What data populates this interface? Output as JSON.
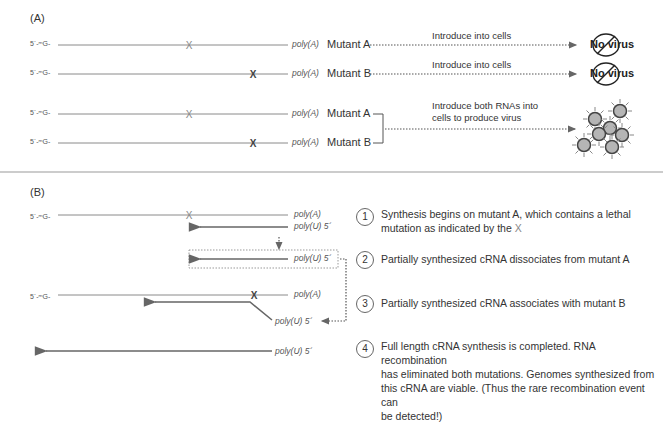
{
  "panel_a": {
    "label": "(A)",
    "rows": [
      {
        "cap": "5´-ᵐG-",
        "poly": "poly(A)",
        "mutant": "Mutant A",
        "note": "Introduce into cells",
        "result": "No virus"
      },
      {
        "cap": "5´-ᵐG-",
        "poly": "poly(A)",
        "mutant": "Mutant B",
        "note": "Introduce into cells",
        "result": "No virus"
      },
      {
        "cap": "5´-ᵐG-",
        "poly": "poly(A)",
        "mutant": "Mutant A"
      },
      {
        "cap": "5´-ᵐG-",
        "poly": "poly(A)",
        "mutant": "Mutant B"
      }
    ],
    "combined_note_line1": "Introduce both RNAs into",
    "combined_note_line2": "cells to produce virus",
    "icons": {
      "no_virus": "prohibition-circle",
      "virus": "virus-particle-cluster"
    }
  },
  "panel_b": {
    "label": "(B)",
    "cap": "5´-ᵐG-",
    "poly_a": "poly(A)",
    "poly_u": "poly(U) 5´",
    "steps": [
      {
        "num": "1",
        "line1": "Synthesis begins on mutant A, which contains a lethal",
        "line2": "mutation as indicated by the ",
        "x_mark": "X"
      },
      {
        "num": "2",
        "line1": "Partially synthesized cRNA dissociates from mutant A"
      },
      {
        "num": "3",
        "line1": "Partially synthesized cRNA associates with mutant B"
      },
      {
        "num": "4",
        "line1": "Full length cRNA synthesis is completed. RNA recombination",
        "line2": "has eliminated both mutations. Genomes synthesized from",
        "line3": "this cRNA are viable. (Thus the rare recombination event can",
        "line4": "be detected!)"
      }
    ]
  },
  "colors": {
    "line": "#8a8a8a",
    "arrow": "#707070",
    "virus_fill": "#b8b8b8",
    "virus_stroke": "#444444",
    "x_gray": "#888888",
    "x_dark": "#555555"
  }
}
